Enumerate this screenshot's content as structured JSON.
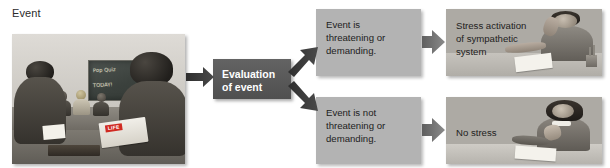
{
  "diagram": {
    "title_label": "Event",
    "nodes": {
      "event_photo": {
        "name": "classroom-photo",
        "alt": "Students in a classroom with a chalkboard reading Pop Quiz TODAY!",
        "chalkboard_line1": "Pop Quiz",
        "chalkboard_line2": "TODAY!",
        "magazine_logo": "LIFE"
      },
      "evaluation": {
        "line1": "Evaluation",
        "line2": "of event"
      },
      "threatening": {
        "line1": "Event is",
        "line2": "threatening or",
        "line3": "demanding."
      },
      "not_threatening": {
        "line1": "Event is not",
        "line2": "threatening or",
        "line3": "demanding."
      },
      "stress_outcome": {
        "line1": "Stress activation",
        "line2": "of sympathetic",
        "line3": "system",
        "alt": "Stressed student holding head while writing"
      },
      "no_stress_outcome": {
        "line1": "No stress",
        "line2": "",
        "line3": "",
        "alt": "Relaxed student resting chin on hands at a desk"
      }
    },
    "colors": {
      "grey_box": "#b3b3b3",
      "dark_box": "#565656",
      "dark_arrow": "#3a3a3a",
      "grey_arrow": "#6e6e6e",
      "page_background": "#ffffff",
      "text": "#1d1d1d"
    }
  }
}
